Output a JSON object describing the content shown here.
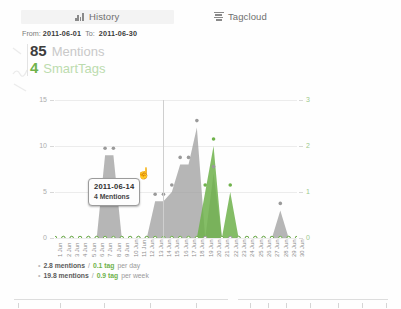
{
  "tabs": [
    {
      "label": "History",
      "icon": "bar-chart-icon",
      "active": true
    },
    {
      "label": "Tagcloud",
      "icon": "tagcloud-icon",
      "active": false
    }
  ],
  "daterange": {
    "from_label": "From:",
    "from_value": "2011-06-01",
    "to_label": "To:",
    "to_value": "2011-06-30"
  },
  "summary": {
    "mentions_count": "85",
    "mentions_label": "Mentions",
    "smarttags_count": "4",
    "smarttags_label": "SmartTags"
  },
  "tooltip": {
    "date": "2011-06-14",
    "value": "4 Mentions"
  },
  "stats": [
    {
      "value": "2.8 mentions",
      "sep": "/",
      "tag": "0.1 tag",
      "suffix": "per day"
    },
    {
      "value": "19.8 mentions",
      "sep": "/",
      "tag": "0.9 tag",
      "suffix": "per week"
    }
  ],
  "colors": {
    "mentions": "#9a9a9a",
    "smarttags": "#6fb24b",
    "grid": "#ececec",
    "axis_left": "#adadad",
    "axis_right": "#9cc98c"
  },
  "chart_data": {
    "type": "area",
    "title": "",
    "xlabel": "",
    "ylabel": "",
    "grid": true,
    "legend": "none",
    "x": [
      "1 Jun",
      "2 Jun",
      "3 Jun",
      "4 Jun",
      "5 Jun",
      "6 Jun",
      "7 Jun",
      "8 Jun",
      "9 Jun",
      "10 Jun",
      "11 Jun",
      "12 Jun",
      "13 Jun",
      "14 Jun",
      "15 Jun",
      "16 Jun",
      "17 Jun",
      "18 Jun",
      "19 Jun",
      "20 Jun",
      "21 Jun",
      "22 Jun",
      "23 Jun",
      "24 Jun",
      "25 Jun",
      "26 Jun",
      "27 Jun",
      "28 Jun",
      "29 Jun",
      "30 Jun"
    ],
    "y_left": {
      "label": "Mentions",
      "ticks": [
        0,
        5,
        10,
        15
      ],
      "lim": [
        0,
        15
      ]
    },
    "y_right": {
      "label": "SmartTags",
      "ticks": [
        0,
        1,
        2,
        3
      ],
      "lim": [
        0,
        3
      ]
    },
    "series": [
      {
        "name": "Mentions",
        "axis": "left",
        "color": "#9a9a9a",
        "values": [
          0,
          0,
          0,
          0,
          0,
          0,
          9,
          9,
          0,
          0,
          0,
          0,
          4,
          4,
          5,
          8,
          8,
          12,
          0,
          7,
          0,
          0,
          0,
          0,
          0,
          0,
          0,
          3,
          0,
          0
        ]
      },
      {
        "name": "SmartTags",
        "axis": "right",
        "color": "#6fb24b",
        "values": [
          0,
          0,
          0,
          0,
          0,
          0,
          0,
          0,
          0,
          0,
          0,
          0,
          0,
          0,
          0,
          0,
          0,
          0,
          1,
          2,
          0,
          1,
          0,
          0,
          0,
          0,
          0,
          0,
          0,
          0
        ]
      }
    ],
    "cursor": {
      "x": "14 Jun",
      "label": "2011-06-14",
      "value": "4 Mentions"
    }
  }
}
